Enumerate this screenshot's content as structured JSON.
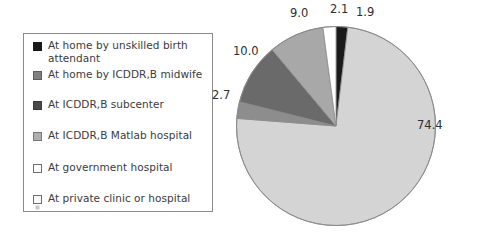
{
  "chart_data": {
    "type": "pie",
    "title": "",
    "subtitle": "",
    "xlabel": "",
    "ylabel": "",
    "grid": false,
    "legend_position": "left",
    "units": "percent",
    "start_angle_deg": 0,
    "direction": "clockwise",
    "categories": [
      "At home by unskilled birth attendant",
      "At home by ICDDR,B midwife",
      "At ICDDR,B subcenter",
      "At ICDDR,B Matlab hospital",
      "At government hospital",
      "At private clinic or hospital"
    ],
    "values": [
      1.9,
      74.4,
      2.7,
      10.0,
      9.0,
      2.1
    ],
    "slice_order_clockwise_from_top": [
      {
        "label": "At home by unskilled birth attendant",
        "value": 1.9,
        "color": "#1a1a1a"
      },
      {
        "label": "At home by ICDDR,B midwife",
        "value": 74.4,
        "color": "#d4d4d4"
      },
      {
        "label": "At ICDDR,B subcenter",
        "value": 2.7,
        "color": "#8d8d8d"
      },
      {
        "label": "At ICDDR,B Matlab hospital",
        "value": 10.0,
        "color": "#6a6a6a"
      },
      {
        "label": "At government hospital",
        "value": 9.0,
        "color": "#a8a8a8"
      },
      {
        "label": "At private clinic or hospital",
        "value": 2.1,
        "color": "#ffffff"
      }
    ]
  },
  "legend": {
    "items": [
      {
        "label": "At home by unskilled birth\nattendant",
        "swatch": "solid-black-swatch"
      },
      {
        "label": "At home by ICDDR,B midwife",
        "swatch": "grey-mid-swatch"
      },
      {
        "label": "At ICDDR,B subcenter",
        "swatch": "grey-dark-swatch"
      },
      {
        "label": "At ICDDR,B Matlab hospital",
        "swatch": "grey-light-swatch"
      },
      {
        "label": "At government hospital",
        "swatch": "white-swatch"
      },
      {
        "label": "At private clinic or hospital",
        "swatch": "white-hatch-swatch"
      }
    ]
  },
  "labels": {
    "l1": "9.0",
    "l2": "2.1",
    "l3": "1.9",
    "l4": "74.4",
    "l5": "10.0",
    "l6": "2.7"
  },
  "colors": {
    "slice_black": "#1a1a1a",
    "slice_light": "#d4d4d4",
    "slice_mid": "#8d8d8d",
    "slice_dark": "#6a6a6a",
    "slice_midlight": "#a8a8a8",
    "slice_white": "#ffffff",
    "outline": "#8a8a8a",
    "text": "#2e2e2e",
    "background": "#ffffff"
  }
}
